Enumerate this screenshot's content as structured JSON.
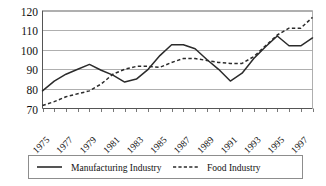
{
  "chart_data": {
    "type": "line",
    "title": "",
    "xlabel": "",
    "ylabel": "",
    "ylim": [
      70,
      120
    ],
    "yticks": [
      70,
      80,
      90,
      100,
      110,
      120
    ],
    "grid": true,
    "legend_position": "bottom",
    "x": [
      1975,
      1976,
      1977,
      1978,
      1979,
      1980,
      1981,
      1982,
      1983,
      1984,
      1985,
      1986,
      1987,
      1988,
      1989,
      1990,
      1991,
      1992,
      1993,
      1994,
      1995,
      1996,
      1997,
      1998
    ],
    "xtick_labels": [
      "1975",
      "1977",
      "1979",
      "1981",
      "1983",
      "1985",
      "1987",
      "1989",
      "1991",
      "1993",
      "1995",
      "1997"
    ],
    "xtick_values": [
      1975,
      1977,
      1979,
      1981,
      1983,
      1985,
      1987,
      1989,
      1991,
      1993,
      1995,
      1997
    ],
    "series": [
      {
        "name": "Manufacturing Industry",
        "style": "solid",
        "color": "#2b2b2b",
        "values": [
          79.0,
          84.0,
          87.5,
          90.0,
          92.5,
          89.5,
          87.0,
          83.5,
          85.0,
          90.0,
          97.0,
          102.5,
          102.5,
          100.5,
          95.0,
          90.0,
          84.0,
          88.0,
          95.5,
          101.5,
          107.0,
          102.0,
          102.0,
          106.0
        ]
      },
      {
        "name": "Food Industry",
        "style": "dashed",
        "color": "#2b2b2b",
        "values": [
          71.5,
          73.5,
          76.0,
          77.5,
          79.0,
          82.5,
          87.5,
          90.0,
          91.5,
          91.5,
          91.0,
          93.5,
          95.5,
          95.5,
          94.5,
          93.5,
          93.0,
          93.0,
          96.5,
          102.0,
          107.5,
          111.0,
          111.0,
          116.5
        ]
      }
    ]
  },
  "legend": {
    "items": [
      {
        "label": "Manufacturing Industry",
        "style": "solid"
      },
      {
        "label": "Food Industry",
        "style": "dashed"
      }
    ]
  }
}
